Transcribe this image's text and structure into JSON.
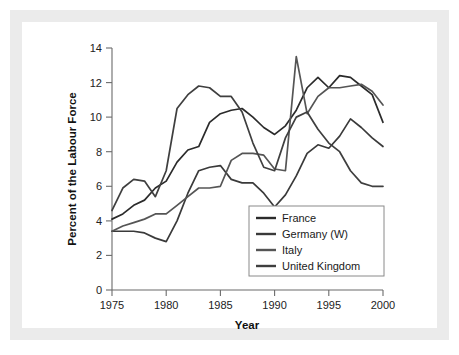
{
  "figure": {
    "background_color": "#ffffff",
    "frame_color": "#ebebeb"
  },
  "chart_data": {
    "type": "line",
    "title": "",
    "xlabel": "Year",
    "ylabel": "Percent of the Labour Force",
    "xlim": [
      1975,
      2000
    ],
    "ylim": [
      0,
      14
    ],
    "xticks": [
      1975,
      1980,
      1985,
      1990,
      1995,
      2000
    ],
    "yticks": [
      0,
      2,
      4,
      6,
      8,
      10,
      12,
      14
    ],
    "xtick_labels": [
      "1975",
      "1980",
      "1985",
      "1990",
      "1995",
      "2000"
    ],
    "ytick_labels": [
      "0",
      "2",
      "4",
      "6",
      "8",
      "10",
      "12",
      "14"
    ],
    "grid": false,
    "legend_position": "lower right",
    "x": [
      1975,
      1976,
      1977,
      1978,
      1979,
      1980,
      1981,
      1982,
      1983,
      1984,
      1985,
      1986,
      1987,
      1988,
      1989,
      1990,
      1991,
      1992,
      1993,
      1994,
      1995,
      1996,
      1997,
      1998,
      1999,
      2000
    ],
    "series": [
      {
        "name": "France",
        "color": "#2b2b2b",
        "values": [
          4.1,
          4.4,
          4.9,
          5.2,
          5.9,
          6.3,
          7.4,
          8.1,
          8.3,
          9.7,
          10.2,
          10.4,
          10.5,
          10.0,
          9.4,
          9.0,
          9.5,
          10.4,
          11.7,
          12.3,
          11.7,
          12.4,
          12.3,
          11.8,
          11.3,
          9.7
        ]
      },
      {
        "name": "Germany (W)",
        "color": "#3a3a3a",
        "values": [
          3.4,
          3.4,
          3.4,
          3.3,
          3.0,
          2.8,
          4.0,
          5.6,
          6.9,
          7.1,
          7.2,
          6.4,
          6.2,
          6.2,
          5.6,
          4.8,
          5.5,
          6.6,
          7.9,
          8.4,
          8.2,
          8.9,
          9.9,
          9.4,
          8.8,
          8.3
        ]
      },
      {
        "name": "Italy",
        "color": "#555555",
        "values": [
          3.4,
          3.7,
          3.9,
          4.1,
          4.4,
          4.4,
          4.9,
          5.4,
          5.9,
          5.9,
          6.0,
          7.5,
          7.9,
          7.9,
          7.8,
          7.0,
          6.9,
          13.5,
          10.2,
          11.2,
          11.7,
          11.7,
          11.8,
          11.9,
          11.5,
          10.7
        ]
      },
      {
        "name": "United Kingdom",
        "color": "#3f3f3f",
        "values": [
          4.6,
          5.9,
          6.4,
          6.3,
          5.4,
          6.9,
          10.5,
          11.3,
          11.8,
          11.7,
          11.2,
          11.2,
          10.3,
          8.5,
          7.1,
          6.9,
          8.8,
          10.0,
          10.3,
          9.3,
          8.5,
          8.0,
          6.9,
          6.2,
          6.0,
          6.0
        ]
      }
    ]
  },
  "legend": {
    "entries": [
      {
        "label": "France"
      },
      {
        "label": "Germany (W)"
      },
      {
        "label": "Italy"
      },
      {
        "label": "United Kingdom"
      }
    ]
  }
}
